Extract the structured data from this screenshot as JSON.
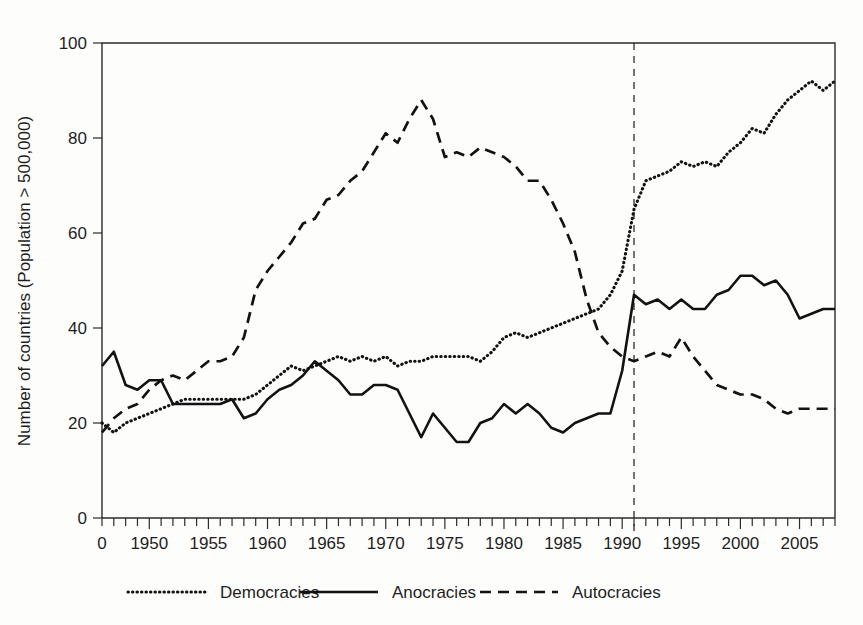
{
  "chart_data": {
    "type": "line",
    "title": "",
    "xlabel": "",
    "ylabel": "Number of countries (Population > 500,000)",
    "xlim": [
      1946,
      2008
    ],
    "ylim": [
      0,
      100
    ],
    "grid": false,
    "legend_position": "bottom",
    "y_ticks": [
      0,
      20,
      40,
      60,
      80,
      100
    ],
    "x_ticks": [
      1950,
      1955,
      1960,
      1965,
      1970,
      1975,
      1980,
      1985,
      1990,
      1995,
      2000,
      2005
    ],
    "x_tick_labels": [
      "1950",
      "1955",
      "1960",
      "1965",
      "1970",
      "1975",
      "1980",
      "1985",
      "1990",
      "1995",
      "2000",
      "2005"
    ],
    "x_origin_label": "0",
    "y_tick_labels": [
      "0",
      "20",
      "40",
      "60",
      "80",
      "100"
    ],
    "annotations": [
      {
        "name": "vertical-marker-1991",
        "x": 1991,
        "style": "dashed-vertical",
        "label": ""
      }
    ],
    "x": [
      1946,
      1947,
      1948,
      1949,
      1950,
      1951,
      1952,
      1953,
      1954,
      1955,
      1956,
      1957,
      1958,
      1959,
      1960,
      1961,
      1962,
      1963,
      1964,
      1965,
      1966,
      1967,
      1968,
      1969,
      1970,
      1971,
      1972,
      1973,
      1974,
      1975,
      1976,
      1977,
      1978,
      1979,
      1980,
      1981,
      1982,
      1983,
      1984,
      1985,
      1986,
      1987,
      1988,
      1989,
      1990,
      1991,
      1992,
      1993,
      1994,
      1995,
      1996,
      1997,
      1998,
      1999,
      2000,
      2001,
      2002,
      2003,
      2004,
      2005,
      2006,
      2007,
      2008
    ],
    "series": [
      {
        "name": "Democracies",
        "style": "dotted",
        "values": [
          20,
          18,
          20,
          21,
          22,
          23,
          24,
          25,
          25,
          25,
          25,
          25,
          25,
          26,
          28,
          30,
          32,
          31,
          32,
          33,
          34,
          33,
          34,
          33,
          34,
          32,
          33,
          33,
          34,
          34,
          34,
          34,
          33,
          35,
          38,
          39,
          38,
          39,
          40,
          41,
          42,
          43,
          44,
          47,
          52,
          65,
          71,
          72,
          73,
          75,
          74,
          75,
          74,
          77,
          79,
          82,
          81,
          85,
          88,
          90,
          92,
          90,
          92
        ]
      },
      {
        "name": "Anocracies",
        "style": "solid",
        "values": [
          32,
          35,
          28,
          27,
          29,
          29,
          24,
          24,
          24,
          24,
          24,
          25,
          21,
          22,
          25,
          27,
          28,
          30,
          33,
          31,
          29,
          26,
          26,
          28,
          28,
          27,
          22,
          17,
          22,
          19,
          16,
          16,
          20,
          21,
          24,
          22,
          24,
          22,
          19,
          18,
          20,
          21,
          22,
          22,
          31,
          47,
          45,
          46,
          44,
          46,
          44,
          44,
          47,
          48,
          51,
          51,
          49,
          50,
          47,
          42,
          43,
          44,
          44
        ]
      },
      {
        "name": "Autocracies",
        "style": "dashed",
        "values": [
          18,
          21,
          23,
          24,
          27,
          29,
          30,
          29,
          31,
          33,
          33,
          34,
          38,
          48,
          52,
          55,
          58,
          62,
          63,
          67,
          68,
          71,
          73,
          77,
          81,
          79,
          84,
          88,
          84,
          76,
          77,
          76,
          78,
          77,
          76,
          74,
          71,
          71,
          67,
          62,
          56,
          46,
          39,
          36,
          34,
          33,
          34,
          35,
          34,
          38,
          34,
          31,
          28,
          27,
          26,
          26,
          25,
          23,
          22,
          23,
          23,
          23,
          23
        ]
      }
    ]
  },
  "legend": {
    "items": [
      {
        "label": "Democracies",
        "style": "dotted"
      },
      {
        "label": "Anocracies",
        "style": "solid"
      },
      {
        "label": "Autocracies",
        "style": "dashed"
      }
    ]
  },
  "colors": {
    "ink": "#121212",
    "axis": "#2b2b2b",
    "background": "#fdfdfc"
  }
}
